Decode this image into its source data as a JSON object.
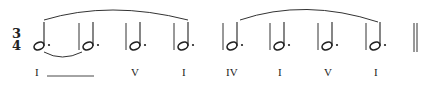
{
  "time_signature": {
    "top": "3",
    "bottom": "4"
  },
  "measures": [
    {
      "note": "dotted-half",
      "stem_x": 44,
      "roman": "I"
    },
    {
      "note": "dotted-half",
      "stem_x": 94,
      "roman": ""
    },
    {
      "note": "dotted-half",
      "stem_x": 140,
      "roman": "V"
    },
    {
      "note": "dotted-half",
      "stem_x": 189,
      "roman": "I"
    },
    {
      "note": "dotted-half",
      "stem_x": 238,
      "roman": "IV"
    },
    {
      "note": "dotted-half",
      "stem_x": 285,
      "roman": "I"
    },
    {
      "note": "dotted-half",
      "stem_x": 333,
      "roman": "V"
    },
    {
      "note": "dotted-half",
      "stem_x": 382,
      "roman": "I"
    }
  ],
  "roman_labels": {
    "m1": "I",
    "m3": "V",
    "m4": "I",
    "m5": "IV",
    "m6": "I",
    "m7": "V",
    "m8": "I"
  },
  "prolongation_line": "I extends over measures 1–2",
  "slurs": [
    {
      "from_measure": 1,
      "to_measure": 4
    },
    {
      "from_measure": 5,
      "to_measure": 8
    }
  ],
  "tie": {
    "from_measure": 1,
    "to_measure": 2
  },
  "final_barline": "double"
}
